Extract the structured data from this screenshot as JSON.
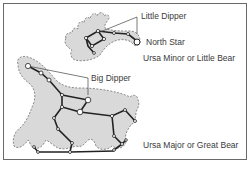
{
  "diagram": {
    "title": "",
    "labels": {
      "little_dipper": "Little Dipper",
      "north_star": "North Star",
      "ursa_minor": "Ursa Minor or Little Bear",
      "big_dipper": "Big Dipper",
      "ursa_major": "Ursa Major or Great Bear"
    },
    "colors": {
      "frame": "#6a6a6a",
      "bear_fill": "#d9d9d9",
      "outline_dash": "#6e6e6e",
      "star_line": "#222222",
      "star_fill": "#ffffff",
      "text": "#3a3a3a"
    }
  }
}
